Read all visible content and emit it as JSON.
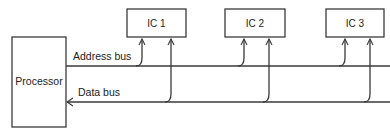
{
  "diagram": {
    "processor": {
      "label": "Processor"
    },
    "buses": {
      "address": {
        "label": "Address bus",
        "direction": "processor-to-ICs"
      },
      "data": {
        "label": "Data bus",
        "direction": "ICs-to-processor"
      }
    },
    "ics": [
      {
        "label": "IC 1"
      },
      {
        "label": "IC 2"
      },
      {
        "label": "IC 3"
      }
    ],
    "colors": {
      "line": "#3a3a3a",
      "box_border": "#2a2a2a",
      "text": "#222222",
      "background": "#ffffff"
    }
  }
}
